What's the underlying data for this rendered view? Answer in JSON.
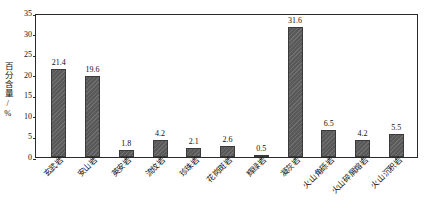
{
  "chart_data": {
    "type": "bar",
    "title": "",
    "subtitle": "",
    "xlabel": "",
    "ylabel": "百分含量/%",
    "ylim": [
      0,
      35
    ],
    "ytick_step": 5,
    "yticks": [
      0,
      5,
      10,
      15,
      20,
      25,
      30,
      35
    ],
    "grid": false,
    "legend": null,
    "legend_position": "none",
    "categories": [
      "玄武岩",
      "安山岩",
      "英安岩",
      "流纹岩",
      "珍珠岩",
      "花岗斑岩",
      "辉绿岩",
      "凝灰岩",
      "火山角砾岩",
      "火山碎屑熔岩",
      "火山沉积岩"
    ],
    "values": [
      21.4,
      19.6,
      1.8,
      4.2,
      2.1,
      2.6,
      0.5,
      31.6,
      6.5,
      4.2,
      5.5
    ],
    "value_labels": [
      "21.4",
      "19.6",
      "1.8",
      "4.2",
      "2.1",
      "2.6",
      "0.5",
      "31.6",
      "6.5",
      "4.2",
      "5.5"
    ],
    "bar_color": "#595959",
    "bar_edge_color": "#3a3a3a",
    "axis_color": "#2b2b2b",
    "text_color": "#111111",
    "background_color": "#ffffff"
  }
}
